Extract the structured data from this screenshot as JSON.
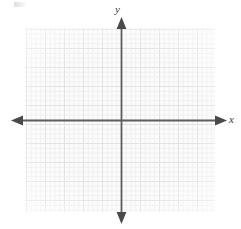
{
  "figure": {
    "kind": "cartesian-coordinate-grid",
    "title": "",
    "background_color": "#ffffff"
  },
  "axes": {
    "x_label": "x",
    "y_label": "y",
    "axis_color": "#5e5e5e",
    "arrowheads": [
      "left",
      "right",
      "up",
      "down"
    ],
    "origin_px": {
      "x": 121,
      "y": 120
    }
  },
  "grid": {
    "minor_color": "#efefef",
    "major_color": "#e2e2e2",
    "paper_color": "#fbfbfb",
    "minor_spacing_px": 4.75,
    "major_spacing_px": 19,
    "minor_per_major": 4,
    "bounds_px": {
      "left": 25,
      "top": 28,
      "width": 190,
      "height": 184
    }
  },
  "chart_data": {
    "type": "scatter",
    "title": "",
    "subtitle": "",
    "xlabel": "x",
    "ylabel": "y",
    "series": [
      {
        "name": "",
        "x": [],
        "y": []
      }
    ],
    "x": [],
    "categories": [],
    "values": [],
    "xlim": [
      -10,
      10
    ],
    "ylim": [
      -10,
      10
    ],
    "xticks": [],
    "yticks": [],
    "xticklabels": [],
    "yticklabels": [],
    "grid": true,
    "legend": false,
    "legend_position": "none",
    "annotations": []
  }
}
